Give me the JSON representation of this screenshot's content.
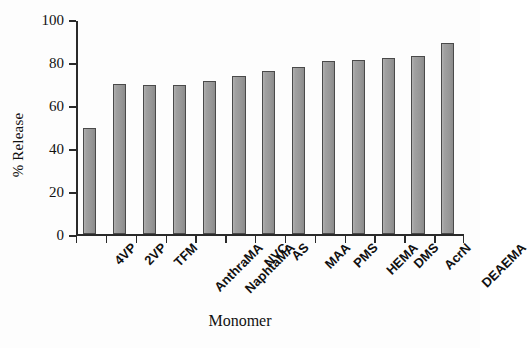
{
  "chart_data": {
    "type": "bar",
    "title": "",
    "xlabel": "Monomer",
    "ylabel": "% Release",
    "categories": [
      "4VP",
      "2VP",
      "TFM",
      "AnthraMA",
      "NaphtaMA",
      "NVC",
      "AS",
      "MAA",
      "PMS",
      "HEMA",
      "DMS",
      "AcrN",
      "DEAEMA"
    ],
    "values": [
      49.5,
      70,
      69.5,
      69.5,
      71.5,
      73.5,
      76,
      78,
      80.5,
      81,
      82,
      83,
      89
    ],
    "ylim": [
      0,
      100
    ],
    "yticks": [
      0,
      20,
      40,
      60,
      80,
      100
    ],
    "ytick_labels": [
      "0",
      "20",
      "40",
      "60",
      "80",
      "100"
    ],
    "grid": false,
    "legend": false,
    "bar_color": "#9b9b9b",
    "bar_edge_color": "#4a4a4a",
    "axis_color": "#2a2a2a",
    "background": "#fdfdfd"
  }
}
